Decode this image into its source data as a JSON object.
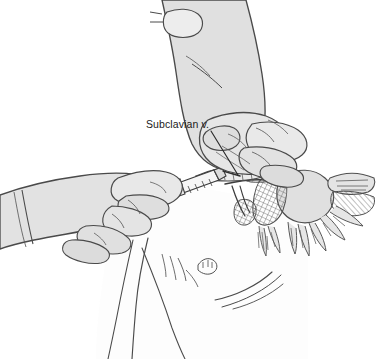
{
  "figure": {
    "kind": "medical-line-illustration",
    "background_color": "#ffffff",
    "ink_color": "#3a3a3a",
    "outline_color": "#555555",
    "skin_fill_light": "#f7f7f7",
    "glove_fill": "#e3e3e3",
    "glove_fill_dark": "#d4d4d4",
    "muscle_fill": "#dedede",
    "hatch_color": "#666666"
  },
  "annotations": {
    "labels": [
      {
        "id": "subclavian-vein",
        "text": "Subclavian v.",
        "x": 146,
        "y": 128,
        "leader": {
          "from_x": 211,
          "from_y": 131,
          "to_x": 238,
          "to_y": 175
        }
      }
    ]
  },
  "scene": {
    "elements": [
      {
        "name": "patient-torso",
        "description": "Supine patient chest and shoulder"
      },
      {
        "name": "clinician-left-hand",
        "description": "Hand holding syringe at infraclavicular site"
      },
      {
        "name": "clinician-right-hand",
        "description": "Hand palpating suprasternal notch"
      },
      {
        "name": "syringe",
        "description": "Syringe with needle entering beneath clavicle"
      },
      {
        "name": "clavicle",
        "description": "Clavicle bone landmark"
      },
      {
        "name": "subclavian-vein",
        "description": "Target vessel beneath clavicle"
      },
      {
        "name": "shoulder-musculature",
        "description": "Deltoid and pectoral muscle detail"
      }
    ]
  }
}
